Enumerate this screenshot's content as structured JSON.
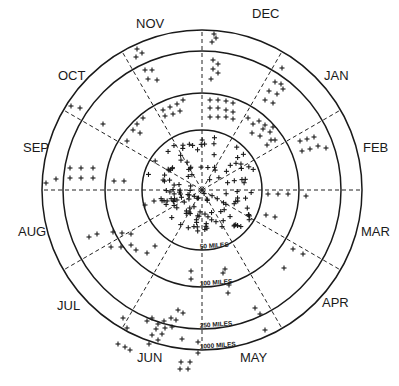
{
  "diagram": {
    "type": "polar-month-distance-diagram",
    "center": [
      202,
      190
    ],
    "rings": [
      {
        "label": "50 MILES",
        "radius": 60
      },
      {
        "label": "100 MILES",
        "radius": 97
      },
      {
        "label": "250 MILES",
        "radius": 139
      },
      {
        "label": "1000 MILES",
        "radius": 160
      }
    ],
    "months": [
      {
        "label": "DEC",
        "x": 252,
        "y": 18
      },
      {
        "label": "JAN",
        "x": 324,
        "y": 80
      },
      {
        "label": "FEB",
        "x": 363,
        "y": 152
      },
      {
        "label": "MAR",
        "x": 361,
        "y": 236
      },
      {
        "label": "APR",
        "x": 322,
        "y": 307
      },
      {
        "label": "MAY",
        "x": 240,
        "y": 362
      },
      {
        "label": "JUN",
        "x": 137,
        "y": 362
      },
      {
        "label": "JUL",
        "x": 57,
        "y": 310
      },
      {
        "label": "AUG",
        "x": 18,
        "y": 236
      },
      {
        "label": "SEP",
        "x": 23,
        "y": 152
      },
      {
        "label": "OCT",
        "x": 58,
        "y": 80
      },
      {
        "label": "NOV",
        "x": 136,
        "y": 28
      }
    ],
    "spoke_angles_deg": [
      -90,
      -60,
      -30,
      0,
      30,
      60,
      90,
      120,
      150,
      180,
      210,
      240
    ],
    "points": [
      [
        137,
        49
      ],
      [
        142,
        53
      ],
      [
        136,
        57
      ],
      [
        145,
        70
      ],
      [
        152,
        70
      ],
      [
        148,
        79
      ],
      [
        157,
        80
      ],
      [
        214,
        34
      ],
      [
        216,
        38
      ],
      [
        212,
        42
      ],
      [
        213,
        60
      ],
      [
        218,
        64
      ],
      [
        213,
        69
      ],
      [
        218,
        73
      ],
      [
        211,
        79
      ],
      [
        282,
        68
      ],
      [
        275,
        82
      ],
      [
        281,
        84
      ],
      [
        269,
        91
      ],
      [
        277,
        94
      ],
      [
        283,
        89
      ],
      [
        265,
        100
      ],
      [
        273,
        103
      ],
      [
        273,
        127
      ],
      [
        326,
        148
      ],
      [
        300,
        141
      ],
      [
        307,
        139
      ],
      [
        314,
        137
      ],
      [
        302,
        151
      ],
      [
        310,
        149
      ],
      [
        318,
        146
      ],
      [
        71,
        106
      ],
      [
        80,
        108
      ],
      [
        103,
        124
      ],
      [
        137,
        124
      ],
      [
        143,
        118
      ],
      [
        133,
        130
      ],
      [
        140,
        133
      ],
      [
        127,
        141
      ],
      [
        163,
        110
      ],
      [
        170,
        107
      ],
      [
        177,
        104
      ],
      [
        183,
        100
      ],
      [
        165,
        116
      ],
      [
        173,
        114
      ],
      [
        180,
        111
      ],
      [
        210,
        100
      ],
      [
        218,
        100
      ],
      [
        226,
        101
      ],
      [
        233,
        103
      ],
      [
        210,
        108
      ],
      [
        218,
        108
      ],
      [
        226,
        110
      ],
      [
        233,
        112
      ],
      [
        210,
        117
      ],
      [
        218,
        117
      ],
      [
        226,
        117
      ],
      [
        233,
        119
      ],
      [
        248,
        118
      ],
      [
        253,
        124
      ],
      [
        259,
        121
      ],
      [
        263,
        129
      ],
      [
        252,
        133
      ],
      [
        260,
        136
      ],
      [
        265,
        125
      ],
      [
        270,
        132
      ],
      [
        275,
        140
      ],
      [
        267,
        145
      ],
      [
        271,
        140
      ],
      [
        70,
        168
      ],
      [
        81,
        168
      ],
      [
        93,
        168
      ],
      [
        70,
        178
      ],
      [
        81,
        178
      ],
      [
        93,
        178
      ],
      [
        46,
        183
      ],
      [
        56,
        179
      ],
      [
        114,
        181
      ],
      [
        124,
        181
      ],
      [
        268,
        194
      ],
      [
        278,
        194
      ],
      [
        288,
        194
      ],
      [
        306,
        196
      ],
      [
        89,
        237
      ],
      [
        97,
        234
      ],
      [
        113,
        232
      ],
      [
        122,
        233
      ],
      [
        131,
        234
      ],
      [
        111,
        247
      ],
      [
        121,
        247
      ],
      [
        131,
        245
      ],
      [
        145,
        205
      ],
      [
        154,
        201
      ],
      [
        136,
        250
      ],
      [
        147,
        253
      ],
      [
        155,
        246
      ],
      [
        266,
        215
      ],
      [
        275,
        217
      ],
      [
        293,
        249
      ],
      [
        303,
        254
      ],
      [
        229,
        285
      ],
      [
        228,
        293
      ],
      [
        223,
        273
      ],
      [
        225,
        269
      ],
      [
        284,
        268
      ],
      [
        255,
        308
      ],
      [
        260,
        314
      ],
      [
        265,
        330
      ],
      [
        191,
        271
      ],
      [
        191,
        279
      ],
      [
        178,
        310
      ],
      [
        183,
        313
      ],
      [
        171,
        318
      ],
      [
        176,
        320
      ],
      [
        152,
        318
      ],
      [
        158,
        324
      ],
      [
        164,
        321
      ],
      [
        147,
        321
      ],
      [
        156,
        329
      ],
      [
        165,
        328
      ],
      [
        172,
        327
      ],
      [
        152,
        335
      ],
      [
        162,
        334
      ],
      [
        158,
        340
      ],
      [
        149,
        344
      ],
      [
        181,
        362
      ],
      [
        190,
        362
      ],
      [
        180,
        369
      ],
      [
        188,
        369
      ],
      [
        182,
        339
      ],
      [
        198,
        342
      ],
      [
        198,
        353
      ],
      [
        123,
        318
      ],
      [
        127,
        328
      ],
      [
        118,
        344
      ],
      [
        125,
        347
      ],
      [
        130,
        350
      ]
    ],
    "center_cluster_count": 140
  }
}
